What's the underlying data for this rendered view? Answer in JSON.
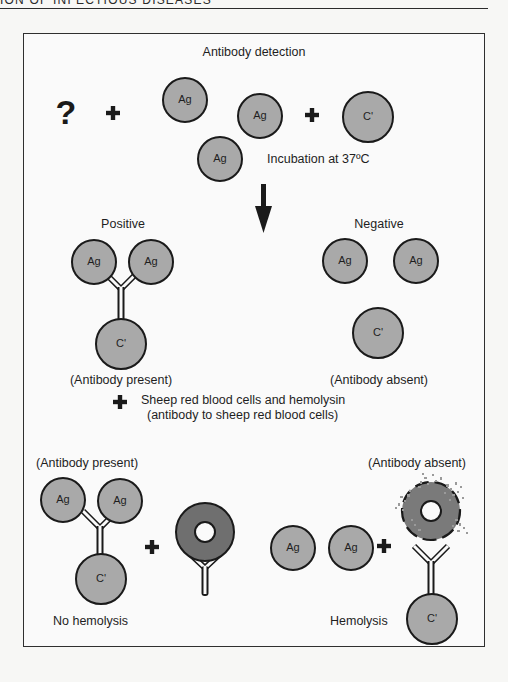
{
  "page_header": {
    "text": "ION OF INFECTIOUS DISEASES"
  },
  "figure": {
    "title": "Antibody detection",
    "step1": {
      "unknown_symbol": "?",
      "antigen_label": "Ag",
      "complement_label": "C'",
      "plus": "+",
      "incubation_text": "Incubation at 37ºC"
    },
    "results": {
      "positive": {
        "title": "Positive",
        "caption": "(Antibody present)",
        "antigen_label": "Ag",
        "complement_label": "C'"
      },
      "negative": {
        "title": "Negative",
        "caption": "(Antibody absent)",
        "antigen_label": "Ag",
        "complement_label": "C'"
      }
    },
    "indicator_step": {
      "line1": "Sheep red blood cells and hemolysin",
      "line2": "(antibody to sheep red blood cells)"
    },
    "outcomes": {
      "left": {
        "caption_top": "(Antibody present)",
        "caption_bottom": "No hemolysis",
        "antigen_label": "Ag",
        "complement_label": "C'"
      },
      "right": {
        "caption_top": "(Antibody absent)",
        "caption_bottom": "Hemolysis",
        "antigen_label": "Ag",
        "complement_label": "C'"
      }
    },
    "colors": {
      "antigen_fill": "#a9a9a9",
      "complement_fill": "#a9a9a9",
      "rbc_fill": "#6f6f6f",
      "outline": "#1a1a1a",
      "background": "#fafafa"
    }
  }
}
